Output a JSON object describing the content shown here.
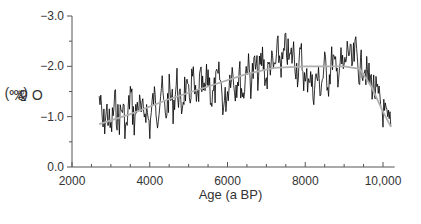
{
  "chart_data": {
    "type": "line",
    "title": "",
    "xlabel": "Age (a BP)",
    "ylabel": "δ18O (‰)",
    "ylabel_parts": {
      "prefix": "δ",
      "sup": "18",
      "suffix": "O (‰)"
    },
    "xlim": [
      2000,
      10300
    ],
    "ylim": [
      0.0,
      -3.0
    ],
    "y_inverted": true,
    "x_ticks": [
      2000,
      4000,
      6000,
      8000,
      10000
    ],
    "x_tick_labels": [
      "2000",
      "4000",
      "6000",
      "8000",
      "10,000"
    ],
    "x_minor_step": 500,
    "y_ticks": [
      0.0,
      -1.0,
      -2.0,
      -3.0
    ],
    "y_tick_labels": [
      "0.0",
      "−1.0",
      "−2.0",
      "−3.0"
    ],
    "y_minor_step": 0.5,
    "grid": false,
    "legend": null,
    "series": [
      {
        "name": "raw δ18O",
        "color": "#000000",
        "style": "noisy line",
        "x": [
          2700,
          2800,
          2900,
          3000,
          3100,
          3200,
          3300,
          3400,
          3500,
          3600,
          3700,
          3800,
          3900,
          4000,
          4100,
          4200,
          4300,
          4400,
          4500,
          4600,
          4700,
          4800,
          4900,
          5000,
          5100,
          5200,
          5300,
          5400,
          5500,
          5600,
          5700,
          5800,
          5900,
          6000,
          6100,
          6200,
          6300,
          6400,
          6500,
          6600,
          6700,
          6800,
          6900,
          7000,
          7100,
          7200,
          7300,
          7400,
          7500,
          7600,
          7700,
          7800,
          7900,
          8000,
          8100,
          8200,
          8300,
          8400,
          8500,
          8600,
          8700,
          8800,
          8900,
          9000,
          9100,
          9200,
          9300,
          9400,
          9500,
          9600,
          9700,
          9800,
          9900,
          10000,
          10100,
          10200
        ],
        "values": [
          -1.4,
          -0.8,
          -1.1,
          -0.7,
          -1.3,
          -0.9,
          -1.2,
          -0.7,
          -1.5,
          -0.9,
          -1.3,
          -1.0,
          -1.2,
          -0.8,
          -1.4,
          -1.1,
          -1.6,
          -1.0,
          -1.5,
          -1.2,
          -1.7,
          -1.1,
          -1.6,
          -1.3,
          -1.8,
          -1.2,
          -1.7,
          -1.4,
          -1.9,
          -1.3,
          -1.6,
          -1.8,
          -1.2,
          -1.5,
          -2.0,
          -1.6,
          -1.9,
          -1.4,
          -2.1,
          -1.7,
          -2.0,
          -1.8,
          -2.2,
          -1.7,
          -2.1,
          -1.9,
          -2.3,
          -2.0,
          -2.4,
          -2.1,
          -2.3,
          -1.9,
          -2.2,
          -1.6,
          -1.9,
          -1.5,
          -1.8,
          -1.6,
          -2.0,
          -1.7,
          -2.2,
          -1.8,
          -2.1,
          -1.9,
          -2.4,
          -2.0,
          -2.3,
          -1.9,
          -2.1,
          -1.8,
          -1.7,
          -1.5,
          -1.3,
          -1.1,
          -0.9,
          -0.8
        ]
      },
      {
        "name": "smoothed trend",
        "color": "#b0b0b0",
        "style": "smooth line",
        "x": [
          2700,
          3500,
          4500,
          5500,
          6500,
          7200,
          8000,
          9000,
          9400,
          9700,
          10000,
          10200
        ],
        "values": [
          -0.85,
          -1.05,
          -1.35,
          -1.6,
          -1.85,
          -1.97,
          -2.0,
          -2.0,
          -1.95,
          -1.6,
          -1.1,
          -0.8
        ]
      }
    ]
  }
}
